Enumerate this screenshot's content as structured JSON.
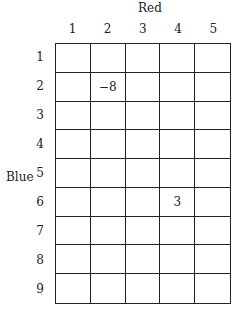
{
  "column_axis_label": "Red",
  "row_axis_label": "Blue",
  "columns": [
    "1",
    "2",
    "3",
    "4",
    "5"
  ],
  "rows": [
    "1",
    "2",
    "3",
    "4",
    "5",
    "6",
    "7",
    "8",
    "9"
  ],
  "cells": [
    [
      "",
      "",
      "",
      "",
      ""
    ],
    [
      "",
      "−8",
      "",
      "",
      ""
    ],
    [
      "",
      "",
      "",
      "",
      ""
    ],
    [
      "",
      "",
      "",
      "",
      ""
    ],
    [
      "",
      "",
      "",
      "",
      ""
    ],
    [
      "",
      "",
      "",
      "3",
      ""
    ],
    [
      "",
      "",
      "",
      "",
      ""
    ],
    [
      "",
      "",
      "",
      "",
      ""
    ],
    [
      "",
      "",
      "",
      "",
      ""
    ]
  ]
}
